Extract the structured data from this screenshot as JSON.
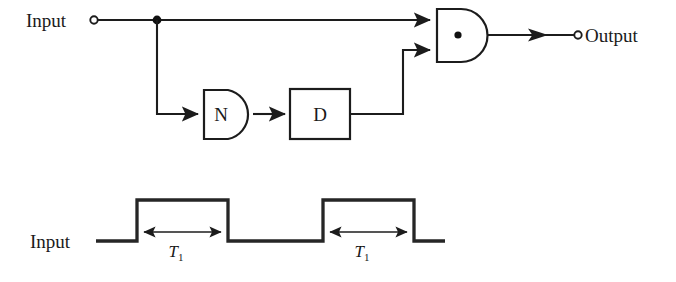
{
  "figure": {
    "colors": {
      "ink": "#1c1c1c",
      "background": "#ffffff",
      "waveform": "#262626"
    }
  },
  "circuit": {
    "input_terminal": {
      "label": "Input",
      "icon": "open-terminal-circle"
    },
    "output_terminal": {
      "label": "Output",
      "icon": "open-terminal-circle"
    },
    "gates": [
      {
        "id": "inverter",
        "label": "N",
        "shape": "d-shape-gate"
      },
      {
        "id": "delay",
        "label": "D",
        "shape": "rectangle-block"
      },
      {
        "id": "and-gate",
        "label": "",
        "center_marker": "•",
        "shape": "and-gate"
      }
    ],
    "junction": {
      "name": "branch-node",
      "icon": "solid-junction-dot"
    }
  },
  "waveform": {
    "signal_label": "Input",
    "pulses": [
      {
        "index": 1,
        "duration_label": "T",
        "duration_subscript": "1"
      },
      {
        "index": 2,
        "duration_label": "T",
        "duration_subscript": "1"
      }
    ]
  }
}
